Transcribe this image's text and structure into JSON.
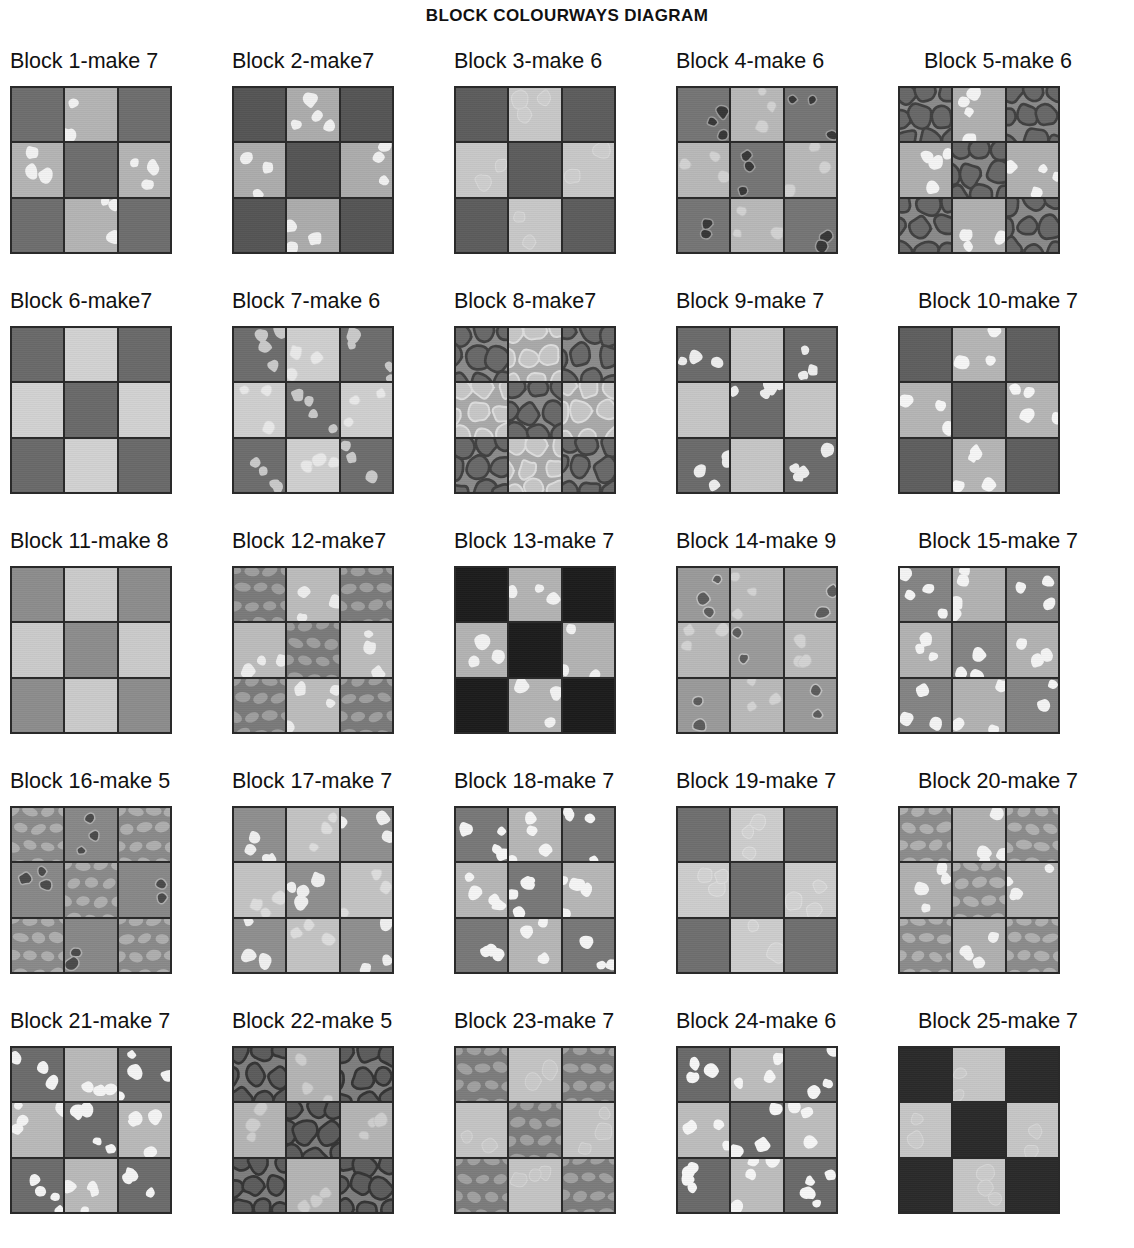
{
  "title": "BLOCK  COLOURWAYS DIAGRAM",
  "layout": {
    "columns": 5,
    "rows": 5,
    "block_count": 25,
    "patch_layout": "3x3 nine-patch checkerboard",
    "patch_roles": [
      "dark",
      "light",
      "dark",
      "light",
      "dark",
      "light",
      "dark",
      "light",
      "dark"
    ]
  },
  "palette": {
    "page_background": "#ffffff",
    "text": "#111111",
    "seam_line": "#2a2a2a"
  },
  "blocks": [
    {
      "index": 1,
      "label": "Block 1-make 7",
      "dark_color": "#6e6e6e",
      "light_color": "#b4b4b4",
      "dark_print": "solid",
      "light_print": "white-dots",
      "dot_color": "#f2f2f2"
    },
    {
      "index": 2,
      "label": "Block 2-make7",
      "dark_color": "#555555",
      "light_color": "#acacac",
      "dark_print": "solid",
      "light_print": "white-dots",
      "dot_color": "#f0f0f0"
    },
    {
      "index": 3,
      "label": "Block 3-make 6",
      "dark_color": "#5d5d5d",
      "light_color": "#c8c8c8",
      "dark_print": "solid",
      "light_print": "faint-outline-circles",
      "dot_color": "#dcdcdc"
    },
    {
      "index": 4,
      "label": "Block 4-make 6",
      "dark_color": "#757575",
      "light_color": "#b8b8b8",
      "dark_print": "dark-blobs",
      "light_print": "tonal-dots",
      "dot_color": "#535353"
    },
    {
      "index": 5,
      "label": "Block 5-make 6",
      "dark_color": "#8a8a8a",
      "light_color": "#b0b0b0",
      "dark_print": "large-pebbles",
      "light_print": "white-dots",
      "dot_color": "#f4f4f4"
    },
    {
      "index": 6,
      "label": "Block 6-make7",
      "dark_color": "#6a6a6a",
      "light_color": "#d2d2d2",
      "dark_print": "solid",
      "light_print": "solid",
      "dot_color": "#e8e8e8"
    },
    {
      "index": 7,
      "label": "Block 7-make 6",
      "dark_color": "#6d6d6d",
      "light_color": "#cfcfcf",
      "dark_print": "light-dots",
      "light_print": "tonal-dots",
      "dot_color": "#c9c9c9"
    },
    {
      "index": 8,
      "label": "Block 8-make7",
      "dark_color": "#8b8b8b",
      "light_color": "#a9a9a9",
      "dark_print": "large-pebbles",
      "light_print": "light-pebbles",
      "dot_color": "#e6e6e6"
    },
    {
      "index": 9,
      "label": "Block 9-make 7",
      "dark_color": "#6b6b6b",
      "light_color": "#c6c6c6",
      "dark_print": "light-dots",
      "light_print": "solid",
      "dot_color": "#ededed"
    },
    {
      "index": 10,
      "label": "Block 10-make 7",
      "dark_color": "#5f5f5f",
      "light_color": "#b5b5b5",
      "dark_print": "solid",
      "light_print": "white-dots",
      "dot_color": "#f6f6f6"
    },
    {
      "index": 11,
      "label": "Block 11-make 8",
      "dark_color": "#8d8d8d",
      "light_color": "#cbcbcb",
      "dark_print": "solid",
      "light_print": "solid",
      "dot_color": "#e0e0e0"
    },
    {
      "index": 12,
      "label": "Block 12-make7",
      "dark_color": "#7a7a7a",
      "light_color": "#bcbcbc",
      "dark_print": "oval-cobblestone",
      "light_print": "white-dots",
      "dot_color": "#ededed"
    },
    {
      "index": 13,
      "label": "Block 13-make 7",
      "dark_color": "#1c1c1c",
      "light_color": "#b3b3b3",
      "dark_print": "solid",
      "light_print": "white-dots",
      "dot_color": "#f2f2f2"
    },
    {
      "index": 14,
      "label": "Block 14-make 9",
      "dark_color": "#9a9a9a",
      "light_color": "#b9b9b9",
      "dark_print": "dark-blobs",
      "light_print": "tonal-dots",
      "dot_color": "#5a5a5a"
    },
    {
      "index": 15,
      "label": "Block 15-make 7",
      "dark_color": "#848484",
      "light_color": "#b2b2b2",
      "dark_print": "light-dots",
      "light_print": "white-dots",
      "dot_color": "#f4f4f4"
    },
    {
      "index": 16,
      "label": "Block 16-make 5",
      "dark_color": "#8a8a8a",
      "light_color": "#888888",
      "dark_print": "oval-cobblestone",
      "light_print": "dark-blobs",
      "dot_color": "#3a3a3a"
    },
    {
      "index": 17,
      "label": "Block 17-make 7",
      "dark_color": "#8f8f8f",
      "light_color": "#c3c3c3",
      "dark_print": "light-dots",
      "light_print": "tonal-dots",
      "dot_color": "#efefef"
    },
    {
      "index": 18,
      "label": "Block 18-make 7",
      "dark_color": "#787878",
      "light_color": "#b6b6b6",
      "dark_print": "light-dots",
      "light_print": "white-dots",
      "dot_color": "#f5f5f5"
    },
    {
      "index": 19,
      "label": "Block 19-make 7",
      "dark_color": "#6f6f6f",
      "light_color": "#cdcdcd",
      "dark_print": "solid",
      "light_print": "faint-outline-circles",
      "dot_color": "#e2e2e2"
    },
    {
      "index": 20,
      "label": "Block 20-make 7",
      "dark_color": "#8c8c8c",
      "light_color": "#b0b0b0",
      "dark_print": "oval-cobblestone",
      "light_print": "white-dots",
      "dot_color": "#f3f3f3"
    },
    {
      "index": 21,
      "label": "Block 21-make 7",
      "dark_color": "#6c6c6c",
      "light_color": "#b9b9b9",
      "dark_print": "light-dots",
      "light_print": "white-dots",
      "dot_color": "#f4f4f4"
    },
    {
      "index": 22,
      "label": "Block 22-make 5",
      "dark_color": "#7e7e7e",
      "light_color": "#b4b4b4",
      "dark_print": "large-pebbles",
      "light_print": "tonal-dots",
      "dot_color": "#e9e9e9"
    },
    {
      "index": 23,
      "label": "Block 23-make 7",
      "dark_color": "#7c7c7c",
      "light_color": "#c4c4c4",
      "dark_print": "oval-cobblestone",
      "light_print": "faint-outline-circles",
      "dot_color": "#dadada"
    },
    {
      "index": 24,
      "label": "Block 24-make 6",
      "dark_color": "#6a6a6a",
      "light_color": "#bdbdbd",
      "dark_print": "light-dots",
      "light_print": "white-dots",
      "dot_color": "#f6f6f6"
    },
    {
      "index": 25,
      "label": "Block 25-make 7",
      "dark_color": "#2a2a2a",
      "light_color": "#c6c6c6",
      "dark_print": "solid",
      "light_print": "faint-outline-circles",
      "dot_color": "#dddddd"
    }
  ]
}
